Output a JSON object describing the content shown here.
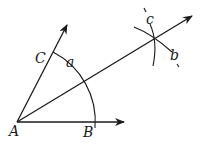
{
  "diagram": {
    "points": {
      "A": {
        "label": "A",
        "x": 17,
        "y": 122
      },
      "B": {
        "label": "B",
        "x": 95,
        "y": 122
      },
      "C": {
        "label": "C",
        "x": 50,
        "y": 55
      }
    },
    "labels": {
      "A": "A",
      "B": "B",
      "C": "C",
      "a": "a",
      "b": "b",
      "c": "c"
    },
    "colors": {
      "stroke": "#1a1a1a",
      "background": "#ffffff"
    }
  }
}
